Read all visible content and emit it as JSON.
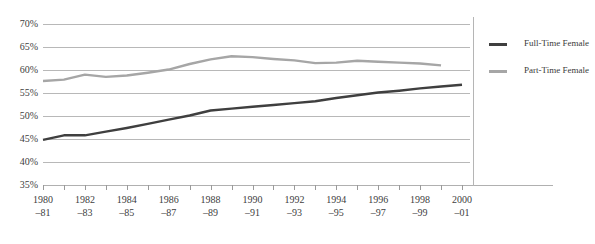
{
  "chart_data": {
    "type": "line",
    "title": "",
    "xlabel": "",
    "ylabel": "",
    "ylim": [
      35,
      70
    ],
    "ytick_labels": [
      "70%",
      "65%",
      "60%",
      "55%",
      "50%",
      "45%",
      "40%",
      "35%"
    ],
    "ytick_values": [
      70,
      65,
      60,
      55,
      50,
      45,
      40,
      35
    ],
    "grid": true,
    "legend_position": "right",
    "categories": [
      "1980–81",
      "1981–82",
      "1982–83",
      "1983–84",
      "1984–85",
      "1985–86",
      "1986–87",
      "1987–88",
      "1988–89",
      "1989–90",
      "1990–91",
      "1991–92",
      "1992–93",
      "1993–94",
      "1994–95",
      "1995–96",
      "1996–97",
      "1997–98",
      "1998–99",
      "1999–2000",
      "2000–01"
    ],
    "xtick_labels": [
      {
        "line1": "1980",
        "line2": "–81"
      },
      {
        "line1": "1982",
        "line2": "–83"
      },
      {
        "line1": "1984",
        "line2": "–85"
      },
      {
        "line1": "1986",
        "line2": "–87"
      },
      {
        "line1": "1988",
        "line2": "–89"
      },
      {
        "line1": "1990",
        "line2": "–91"
      },
      {
        "line1": "1992",
        "line2": "–93"
      },
      {
        "line1": "1994",
        "line2": "–95"
      },
      {
        "line1": "1996",
        "line2": "–97"
      },
      {
        "line1": "1998",
        "line2": "–99"
      },
      {
        "line1": "2000",
        "line2": "–01"
      }
    ],
    "series": [
      {
        "name": "Full-Time Female",
        "legend_line1": "Full-Time",
        "legend_line2": "Female",
        "color": "#3f3f3f",
        "values": [
          44.8,
          45.8,
          45.8,
          46.6,
          47.4,
          48.3,
          49.2,
          50.1,
          51.2,
          51.6,
          52.0,
          52.4,
          52.8,
          53.2,
          53.9,
          54.5,
          55.1,
          55.5,
          56.0,
          56.4,
          56.8
        ]
      },
      {
        "name": "Part-Time Female",
        "legend_line1": "Part-Time",
        "legend_line2": "Female",
        "color": "#a6a6a6",
        "values": [
          57.6,
          57.9,
          59.0,
          58.5,
          58.8,
          59.4,
          60.1,
          61.3,
          62.3,
          63.0,
          62.8,
          62.4,
          62.1,
          61.5,
          61.6,
          62.0,
          61.8,
          61.6,
          61.4,
          61.0,
          null
        ]
      }
    ]
  }
}
